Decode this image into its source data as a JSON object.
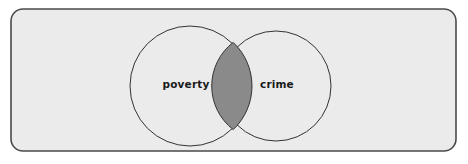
{
  "diagram": {
    "type": "venn",
    "title": "",
    "canvas": {
      "width": 468,
      "height": 164,
      "background": "#ffffff"
    },
    "frame": {
      "name": "universe-box",
      "x": 11,
      "y": 9,
      "width": 445,
      "height": 142,
      "corner_radius": 12,
      "fill": "#ebebeb",
      "stroke": "#4a4a4a",
      "stroke_width": 1.6
    },
    "sets": [
      {
        "id": "poverty",
        "label": "poverty",
        "cx": 190,
        "cy": 86,
        "r": 60,
        "fill": "none",
        "stroke": "#333333",
        "stroke_width": 1,
        "label_x": 186,
        "label_y": 88
      },
      {
        "id": "crime",
        "label": "crime",
        "cx": 276,
        "cy": 86,
        "r": 55,
        "fill": "none",
        "stroke": "#333333",
        "stroke_width": 1,
        "label_x": 277,
        "label_y": 88
      }
    ],
    "intersection": {
      "id": "poverty-and-crime",
      "label": "",
      "fill": "#8a8a8a",
      "stroke": "#333333",
      "stroke_width": 1,
      "path": "M 233.2 42.4 A 55 55 0 0 0 233.2 129.6 A 60 60 0 0 0 233.2 42.4 Z"
    }
  }
}
